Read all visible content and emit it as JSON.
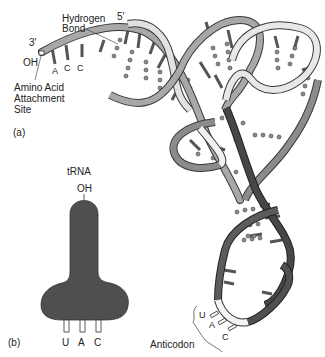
{
  "figure": {
    "panel_a": {
      "label": "(a)",
      "three_prime": "3′",
      "five_prime": "5′",
      "oh": "OH",
      "hydrogen_bond_line1": "Hydrogen",
      "hydrogen_bond_line2": "Bond",
      "terminal_bases": [
        "A",
        "C",
        "C"
      ],
      "amino_site_line1": "Amino Acid",
      "amino_site_line2": "Attachment",
      "amino_site_line3": "Site",
      "anticodon_bases": [
        "U",
        "A",
        "C"
      ],
      "anticodon_label": "Anticodon"
    },
    "panel_b": {
      "label": "(b)",
      "title": "tRNA",
      "oh": "OH",
      "anticodon_bases": [
        "U",
        "A",
        "C"
      ]
    },
    "colors": {
      "strand_light": "#e4e4e4",
      "strand_mid": "#9a9a9a",
      "strand_dark": "#5a5a5a",
      "strand_darkest": "#333333",
      "outline": "#3a3a3a",
      "schematic_fill": "#4f4f4f"
    }
  }
}
